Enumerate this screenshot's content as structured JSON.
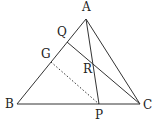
{
  "diagram": {
    "type": "geometry-triangle",
    "line_color": "#333333",
    "points": {
      "A": {
        "label": "A",
        "x": 86,
        "y": 19,
        "lx": 82,
        "ly": 11
      },
      "B": {
        "label": "B",
        "x": 17,
        "y": 104,
        "lx": 5,
        "ly": 108
      },
      "C": {
        "label": "C",
        "x": 140,
        "y": 104,
        "lx": 143,
        "ly": 109
      },
      "P": {
        "label": "P",
        "x": 99,
        "y": 104,
        "lx": 95,
        "ly": 119
      },
      "Q": {
        "label": "Q",
        "x": 67,
        "y": 42,
        "lx": 57,
        "ly": 36
      },
      "G": {
        "label": "G",
        "x": 51,
        "y": 62,
        "lx": 41,
        "ly": 58
      },
      "R": {
        "label": "R",
        "x": 93,
        "y": 63,
        "lx": 83,
        "ly": 73
      }
    },
    "segments": [
      {
        "from": "A",
        "to": "B",
        "style": "solid"
      },
      {
        "from": "B",
        "to": "C",
        "style": "solid"
      },
      {
        "from": "C",
        "to": "A",
        "style": "solid"
      },
      {
        "from": "A",
        "to": "P",
        "style": "solid"
      },
      {
        "from": "Q",
        "to": "C",
        "style": "solid"
      },
      {
        "from": "G",
        "to": "P",
        "style": "dotted"
      }
    ]
  }
}
